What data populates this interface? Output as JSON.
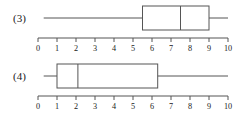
{
  "page": {
    "background_color": "#ffffff",
    "line_color": "#555555",
    "text_color": "#1a1a1a"
  },
  "plots": [
    {
      "label": "(3)",
      "axis": {
        "ticks": [
          "0",
          "1",
          "2",
          "3",
          "4",
          "5",
          "6",
          "7",
          "8",
          "9",
          "10"
        ]
      }
    },
    {
      "label": "(4)",
      "axis": {
        "ticks": [
          "0",
          "1",
          "2",
          "3",
          "4",
          "5",
          "6",
          "7",
          "8",
          "9",
          "10"
        ]
      }
    }
  ],
  "chart_data": [
    {
      "type": "box",
      "name": "(3)",
      "title": "(3)",
      "xlabel": "",
      "ylabel": "",
      "xlim": [
        0,
        10
      ],
      "grid": false,
      "orientation": "horizontal",
      "tick_labels": [
        "0",
        "1",
        "2",
        "3",
        "4",
        "5",
        "6",
        "7",
        "8",
        "9",
        "10"
      ],
      "tick_values": [
        0,
        1,
        2,
        3,
        4,
        5,
        6,
        7,
        8,
        9,
        10
      ],
      "box": {
        "min": 0.3,
        "q1": 5.5,
        "median": 7.5,
        "q3": 9.0,
        "max": 10.0
      }
    },
    {
      "type": "box",
      "name": "(4)",
      "title": "(4)",
      "xlabel": "",
      "ylabel": "",
      "xlim": [
        0,
        10
      ],
      "grid": false,
      "orientation": "horizontal",
      "tick_labels": [
        "0",
        "1",
        "2",
        "3",
        "4",
        "5",
        "6",
        "7",
        "8",
        "9",
        "10"
      ],
      "tick_values": [
        0,
        1,
        2,
        3,
        4,
        5,
        6,
        7,
        8,
        9,
        10
      ],
      "box": {
        "min": 0.3,
        "q1": 1.0,
        "median": 2.1,
        "q3": 6.3,
        "max": 10.0
      }
    }
  ]
}
